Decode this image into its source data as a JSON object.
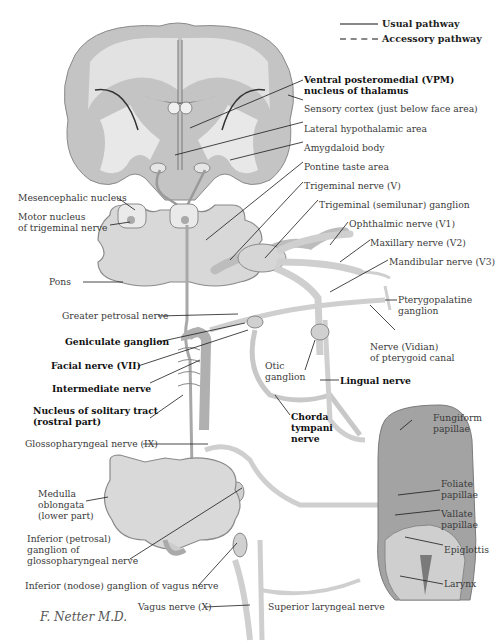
{
  "diagram": {
    "colors": {
      "background": "#ffffff",
      "brain_gray": "#bdbdbd",
      "brain_light": "#dcdcdc",
      "nerve": "#cfcfcf",
      "nerve_outline": "#8a8a8a",
      "leader_line": "#1a1a1a",
      "tongue": "#9d9d9d"
    }
  },
  "legend": {
    "items": [
      {
        "label": "Usual pathway",
        "style": "solid"
      },
      {
        "label": "Accessory pathway",
        "style": "dashed"
      }
    ]
  },
  "labels": {
    "vpm": [
      "Ventral posteromedial (VPM)",
      "nucleus of thalamus"
    ],
    "sensory_cortex": "Sensory cortex (just below face area)",
    "lateral_hypothalamic": "Lateral hypothalamic area",
    "amygdaloid": "Amygdaloid body",
    "pontine_taste": "Pontine taste area",
    "trigeminal_nerve": "Trigeminal nerve (V)",
    "trigeminal_ganglion": "Trigeminal (semilunar) ganglion",
    "ophthalmic": "Ophthalmic nerve (V1)",
    "maxillary": "Maxillary nerve (V2)",
    "mandibular": "Mandibular nerve (V3)",
    "pterygopalatine": [
      "Pterygopalatine",
      "ganglion"
    ],
    "vidian": [
      "Nerve (Vidian)",
      "of pterygoid canal"
    ],
    "lingual": "Lingual nerve",
    "otic": [
      "Otic",
      "ganglion"
    ],
    "chorda_tympani": [
      "Chorda",
      "tympani",
      "nerve"
    ],
    "fungiform": [
      "Fungiform",
      "papillae"
    ],
    "foliate": [
      "Foliate",
      "papillae"
    ],
    "vallate": [
      "Vallate",
      "papillae"
    ],
    "epiglottis": "Epiglottis",
    "larynx": "Larynx",
    "mesencephalic": "Mesencephalic nucleus",
    "motor_nucleus": [
      "Motor nucleus",
      "of trigeminal nerve"
    ],
    "pons": "Pons",
    "greater_petrosal": "Greater petrosal nerve",
    "geniculate": "Geniculate ganglion",
    "facial": "Facial nerve (VII)",
    "intermediate": "Intermediate nerve",
    "solitary_tract": [
      "Nucleus of solitary tract",
      "(rostral part)"
    ],
    "glossopharyngeal": "Glossopharyngeal nerve (IX)",
    "medulla": [
      "Medulla",
      "oblongata",
      "(lower part)"
    ],
    "petrosal_ganglion": [
      "Inferior (petrosal)",
      "ganglion of",
      "glossopharyngeal nerve"
    ],
    "nodose_ganglion": "Inferior (nodose) ganglion of vagus nerve",
    "vagus": "Vagus nerve (X)",
    "superior_laryngeal": "Superior laryngeal nerve",
    "signature": "F. Netter M.D."
  }
}
